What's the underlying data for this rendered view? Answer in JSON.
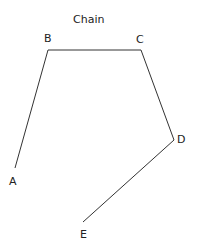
{
  "title": "Chain",
  "nodes": [
    {
      "id": "A",
      "label": "A",
      "x": 15,
      "y": 168
    },
    {
      "id": "B",
      "label": "B",
      "x": 48,
      "y": 50
    },
    {
      "id": "C",
      "label": "C",
      "x": 141,
      "y": 50
    },
    {
      "id": "D",
      "label": "D",
      "x": 174,
      "y": 140
    },
    {
      "id": "E",
      "label": "E",
      "x": 83,
      "y": 222
    }
  ],
  "edges": [
    [
      "A",
      "B"
    ],
    [
      "B",
      "C"
    ],
    [
      "C",
      "D"
    ],
    [
      "D",
      "E"
    ]
  ],
  "line_color": "#333333"
}
